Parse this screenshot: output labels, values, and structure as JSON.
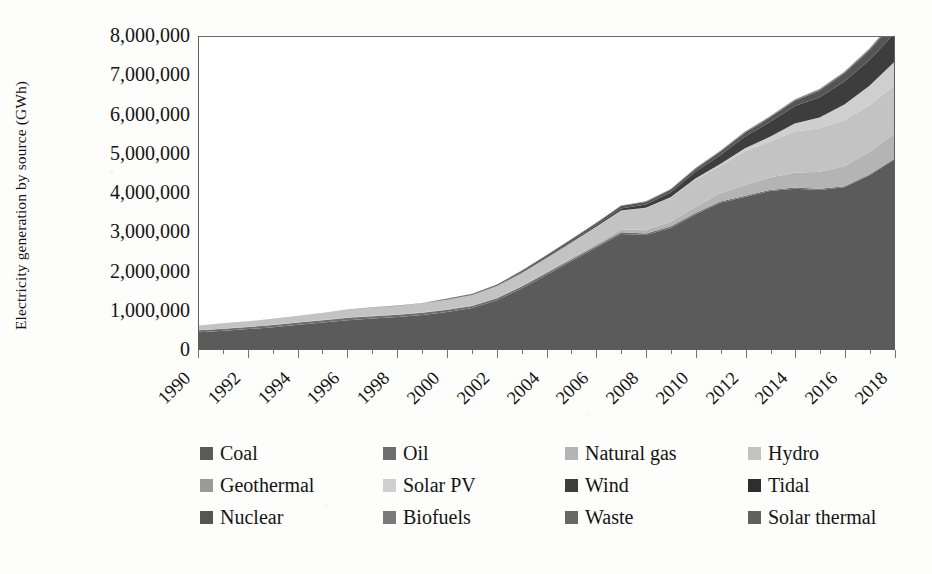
{
  "chart_data": {
    "type": "area",
    "stacked": true,
    "title": "",
    "xlabel": "",
    "ylabel": "Electricity generation by source (GWh)",
    "ylim": [
      0,
      8000000
    ],
    "ytick_labels": [
      "8,000,000",
      "7,000,000",
      "6,000,000",
      "5,000,000",
      "4,000,000",
      "3,000,000",
      "2,000,000",
      "1,000,000",
      "0"
    ],
    "ytick_values": [
      8000000,
      7000000,
      6000000,
      5000000,
      4000000,
      3000000,
      2000000,
      1000000,
      0
    ],
    "grid": false,
    "legend_position": "bottom",
    "x": [
      1990,
      1991,
      1992,
      1993,
      1994,
      1995,
      1996,
      1997,
      1998,
      1999,
      2000,
      2001,
      2002,
      2003,
      2004,
      2005,
      2006,
      2007,
      2008,
      2009,
      2010,
      2011,
      2012,
      2013,
      2014,
      2015,
      2016,
      2017,
      2018
    ],
    "xtick_labels": [
      "1990",
      "1992",
      "1994",
      "1996",
      "1998",
      "2000",
      "2002",
      "2004",
      "2006",
      "2008",
      "2010",
      "2012",
      "2014",
      "2016",
      "2018"
    ],
    "xtick_values": [
      1990,
      1992,
      1994,
      1996,
      1998,
      2000,
      2002,
      2004,
      2006,
      2008,
      2010,
      2012,
      2014,
      2016,
      2018
    ],
    "series": [
      {
        "name": "Coal",
        "color": "#5b5b5b",
        "values": [
          430000,
          470000,
          510000,
          560000,
          620000,
          680000,
          740000,
          780000,
          820000,
          870000,
          950000,
          1050000,
          1250000,
          1550000,
          1900000,
          2250000,
          2600000,
          2950000,
          2920000,
          3100000,
          3450000,
          3750000,
          3900000,
          4050000,
          4110000,
          4080000,
          4150000,
          4450000,
          4850000
        ]
      },
      {
        "name": "Oil",
        "color": "#6e6e6e",
        "values": [
          50000,
          52000,
          54000,
          56000,
          58000,
          60000,
          62000,
          62000,
          60000,
          58000,
          56000,
          54000,
          52000,
          50000,
          48000,
          46000,
          44000,
          42000,
          40000,
          38000,
          36000,
          34000,
          32000,
          30000,
          28000,
          26000,
          24000,
          22000,
          20000
        ]
      },
      {
        "name": "Natural gas",
        "color": "#b4b4b4",
        "values": [
          3000,
          3500,
          4000,
          5000,
          6000,
          7000,
          8000,
          9000,
          10000,
          12000,
          14000,
          17000,
          20000,
          25000,
          32000,
          42000,
          55000,
          72000,
          95000,
          120000,
          160000,
          210000,
          265000,
          320000,
          380000,
          440000,
          510000,
          580000,
          650000
        ]
      },
      {
        "name": "Hydro",
        "color": "#c3c3c3",
        "values": [
          120000,
          130000,
          140000,
          150000,
          165000,
          180000,
          195000,
          210000,
          220000,
          230000,
          245000,
          265000,
          290000,
          320000,
          350000,
          390000,
          430000,
          480000,
          560000,
          620000,
          700000,
          700000,
          870000,
          910000,
          1060000,
          1110000,
          1180000,
          1190000,
          1230000
        ]
      },
      {
        "name": "Geothermal",
        "color": "#9a9a9a",
        "values": [
          1000,
          1000,
          1100,
          1100,
          1200,
          1200,
          1300,
          1300,
          1400,
          1400,
          1500,
          1500,
          1600,
          1600,
          1700,
          1700,
          1800,
          1800,
          1900,
          1900,
          2000,
          2000,
          2100,
          2100,
          2200,
          2200,
          2300,
          2300,
          2400
        ]
      },
      {
        "name": "Solar PV",
        "color": "#cfcfcf",
        "values": [
          0,
          0,
          0,
          0,
          0,
          0,
          0,
          0,
          0,
          0,
          0,
          0,
          100,
          200,
          400,
          800,
          1500,
          3000,
          6000,
          12000,
          25000,
          45000,
          80000,
          130000,
          200000,
          280000,
          400000,
          500000,
          600000
        ]
      },
      {
        "name": "Wind",
        "color": "#3d3d3d",
        "values": [
          0,
          0,
          100,
          200,
          300,
          500,
          800,
          1200,
          1800,
          2500,
          3500,
          5000,
          8000,
          12000,
          18000,
          26000,
          38000,
          56000,
          80000,
          120000,
          170000,
          230000,
          300000,
          380000,
          450000,
          520000,
          590000,
          660000,
          730000
        ]
      },
      {
        "name": "Tidal",
        "color": "#2e2e2e",
        "values": [
          0,
          0,
          0,
          0,
          0,
          0,
          0,
          0,
          0,
          0,
          0,
          0,
          0,
          0,
          0,
          0,
          0,
          0,
          0,
          0,
          0,
          0,
          0,
          0,
          0,
          0,
          0,
          0,
          0
        ]
      },
      {
        "name": "Nuclear",
        "color": "#555555",
        "values": [
          0,
          0,
          0,
          0,
          0,
          0,
          0,
          0,
          0,
          0,
          17000,
          17000,
          25000,
          43000,
          50000,
          53000,
          54000,
          62000,
          68000,
          70000,
          74000,
          87000,
          98000,
          112000,
          133000,
          170000,
          213000,
          248000,
          295000
        ]
      },
      {
        "name": "Biofuels",
        "color": "#7a7a7a",
        "values": [
          1000,
          1200,
          1400,
          1600,
          1800,
          2000,
          2400,
          2800,
          3200,
          3600,
          4000,
          4500,
          5200,
          6000,
          7000,
          8200,
          9600,
          11200,
          13000,
          15000,
          17500,
          20000,
          23000,
          26000,
          29000,
          32000,
          35000,
          38000,
          41000
        ]
      },
      {
        "name": "Waste",
        "color": "#686868",
        "values": [
          500,
          600,
          700,
          800,
          900,
          1000,
          1100,
          1200,
          1300,
          1400,
          1600,
          1800,
          2000,
          2200,
          2500,
          2800,
          3100,
          3500,
          3900,
          4300,
          4800,
          5300,
          5800,
          6300,
          6800,
          7300,
          7800,
          8300,
          8800
        ]
      },
      {
        "name": "Solar thermal",
        "color": "#606060",
        "values": [
          0,
          0,
          0,
          0,
          0,
          0,
          0,
          0,
          0,
          0,
          0,
          0,
          0,
          0,
          0,
          0,
          0,
          0,
          0,
          0,
          0,
          0,
          0,
          0,
          0,
          0,
          0,
          0,
          0
        ]
      }
    ]
  },
  "axis": {
    "y_title": "Electricity generation by source (GWh)"
  },
  "legend": {
    "items": [
      {
        "label": "Coal",
        "color": "#5b5b5b"
      },
      {
        "label": "Oil",
        "color": "#6e6e6e"
      },
      {
        "label": "Natural gas",
        "color": "#b4b4b4"
      },
      {
        "label": "Hydro",
        "color": "#c3c3c3"
      },
      {
        "label": "Geothermal",
        "color": "#9a9a9a"
      },
      {
        "label": "Solar PV",
        "color": "#cfcfcf"
      },
      {
        "label": "Wind",
        "color": "#3d3d3d"
      },
      {
        "label": "Tidal",
        "color": "#2e2e2e"
      },
      {
        "label": "Nuclear",
        "color": "#555555"
      },
      {
        "label": "Biofuels",
        "color": "#7a7a7a"
      },
      {
        "label": "Waste",
        "color": "#686868"
      },
      {
        "label": "Solar thermal",
        "color": "#606060"
      }
    ]
  }
}
